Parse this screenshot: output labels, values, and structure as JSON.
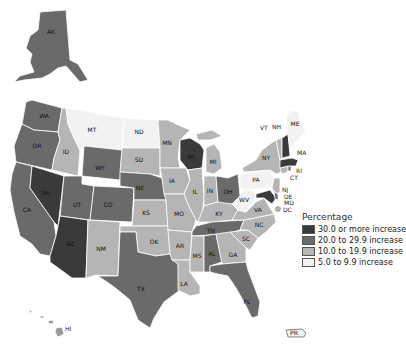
{
  "legend": {
    "title": "Percentage",
    "items": [
      {
        "label": "30.0 or more increase",
        "color": "#3a3a3a"
      },
      {
        "label": "20.0 to 29.9 increase",
        "color": "#6a6a6a"
      },
      {
        "label": "10.0 to 19.9 increase",
        "color": "#b5b5b5"
      },
      {
        "label": "5.0 to 9.9 increase",
        "color": "#f2f2f2"
      }
    ]
  },
  "states": {
    "AK": {
      "label": "AK",
      "class": "20-29.9"
    },
    "HI": {
      "label": "HI",
      "class": "20-29.9"
    },
    "WA": {
      "label": "WA",
      "class": "20-29.9"
    },
    "OR": {
      "label": "OR",
      "class": "20-29.9"
    },
    "CA": {
      "label": "CA",
      "class": "20-29.9"
    },
    "NV": {
      "label": "NV",
      "class": "30+"
    },
    "ID": {
      "label": "ID",
      "class": "10-19.9"
    },
    "MT": {
      "label": "MT",
      "class": "5-9.9"
    },
    "WY": {
      "label": "WY",
      "class": "20-29.9"
    },
    "UT": {
      "label": "UT",
      "class": "20-29.9"
    },
    "CO": {
      "label": "CO",
      "class": "20-29.9"
    },
    "AZ": {
      "label": "AZ",
      "class": "30+"
    },
    "NM": {
      "label": "NM",
      "class": "10-19.9"
    },
    "ND": {
      "label": "ND",
      "class": "5-9.9"
    },
    "SD": {
      "label": "SD",
      "class": "10-19.9"
    },
    "NE": {
      "label": "NE",
      "class": "20-29.9"
    },
    "KS": {
      "label": "KS",
      "class": "10-19.9"
    },
    "OK": {
      "label": "OK",
      "class": "10-19.9"
    },
    "TX": {
      "label": "TX",
      "class": "20-29.9"
    },
    "MN": {
      "label": "MN",
      "class": "10-19.9"
    },
    "IA": {
      "label": "IA",
      "class": "10-19.9"
    },
    "MO": {
      "label": "MO",
      "class": "10-19.9"
    },
    "AR": {
      "label": "AR",
      "class": "10-19.9"
    },
    "LA": {
      "label": "LA",
      "class": "10-19.9"
    },
    "WI": {
      "label": "WI",
      "class": "30+"
    },
    "IL": {
      "label": "IL",
      "class": "10-19.9"
    },
    "MI": {
      "label": "MI",
      "class": "10-19.9"
    },
    "IN": {
      "label": "IN",
      "class": "10-19.9"
    },
    "OH": {
      "label": "OH",
      "class": "20-29.9"
    },
    "KY": {
      "label": "KY",
      "class": "10-19.9"
    },
    "TN": {
      "label": "TN",
      "class": "20-29.9"
    },
    "MS": {
      "label": "MS",
      "class": "10-19.9"
    },
    "AL": {
      "label": "AL",
      "class": "20-29.9"
    },
    "GA": {
      "label": "GA",
      "class": "10-19.9"
    },
    "FL": {
      "label": "FL",
      "class": "20-29.9"
    },
    "SC": {
      "label": "SC",
      "class": "10-19.9"
    },
    "NC": {
      "label": "NC",
      "class": "10-19.9"
    },
    "VA": {
      "label": "VA",
      "class": "10-19.9"
    },
    "WV": {
      "label": "WV",
      "class": "5-9.9"
    },
    "PA": {
      "label": "PA",
      "class": "5-9.9"
    },
    "NY": {
      "label": "NY",
      "class": "10-19.9"
    },
    "VT": {
      "label": "VT",
      "class": "10-19.9"
    },
    "NH": {
      "label": "NH",
      "class": "30+"
    },
    "ME": {
      "label": "ME",
      "class": "5-9.9"
    },
    "MA": {
      "label": "MA",
      "class": "30+"
    },
    "RI": {
      "label": "RI",
      "class": "20-29.9"
    },
    "CT": {
      "label": "CT",
      "class": "10-19.9"
    },
    "NJ": {
      "label": "NJ",
      "class": "10-19.9"
    },
    "DE": {
      "label": "DE",
      "class": "20-29.9"
    },
    "MD": {
      "label": "MD",
      "class": "30+"
    },
    "DC": {
      "label": "DC",
      "class": "10-19.9"
    },
    "PR": {
      "label": "PR",
      "class": "5-9.9"
    }
  }
}
